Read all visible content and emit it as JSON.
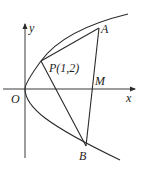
{
  "diagram": {
    "type": "parabola-geometry",
    "curve": "parabola opening right with vertex at origin",
    "axes": {
      "x_label": "x",
      "y_label": "y",
      "origin_label": "O"
    },
    "points": {
      "P": {
        "label": "P(1,2)"
      },
      "A": {
        "label": "A"
      },
      "B": {
        "label": "B"
      },
      "M": {
        "label": "M"
      }
    },
    "segments": [
      "PA",
      "PB",
      "AB"
    ]
  }
}
